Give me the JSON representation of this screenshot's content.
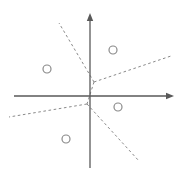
{
  "figure": {
    "title": "",
    "width": 183,
    "height": 174,
    "background_color": "#ffffff",
    "axis_color": "#595959",
    "dashed_color": "#8a8a8a",
    "point_color": "#8a8a8a"
  },
  "chart_data": {
    "type": "scatter",
    "title": "",
    "xlabel": "",
    "ylabel": "",
    "grid": false,
    "legend": null,
    "origin_px": {
      "x": 90,
      "y": 96
    },
    "axes": [
      {
        "name": "x-axis",
        "orientation": "horizontal",
        "start_px": {
          "x": 14,
          "y": 96
        },
        "end_px": {
          "x": 174,
          "y": 96
        },
        "arrow_at": "end",
        "style": "solid"
      },
      {
        "name": "y-axis",
        "orientation": "vertical",
        "start_px": {
          "x": 90,
          "y": 168
        },
        "end_px": {
          "x": 90,
          "y": 13
        },
        "arrow_at": "end",
        "style": "solid"
      }
    ],
    "points": [
      {
        "label": "",
        "marker": "circle-open",
        "x_px": 47,
        "y_px": 69,
        "radius_px": 4
      },
      {
        "label": "",
        "marker": "circle-open",
        "x_px": 113,
        "y_px": 50,
        "radius_px": 4
      },
      {
        "label": "",
        "marker": "circle-open",
        "x_px": 118,
        "y_px": 107,
        "radius_px": 4
      },
      {
        "label": "",
        "marker": "circle-open",
        "x_px": 66,
        "y_px": 139,
        "radius_px": 4
      }
    ],
    "dashed_edges": [
      {
        "name": "upper-left-ray",
        "from_px": {
          "x": 94,
          "y": 82
        },
        "to_px": {
          "x": 59,
          "y": 23
        },
        "style": "dashed"
      },
      {
        "name": "upper-right-ray",
        "from_px": {
          "x": 94,
          "y": 82
        },
        "to_px": {
          "x": 171,
          "y": 56
        },
        "style": "dashed"
      },
      {
        "name": "vertex-connector",
        "from_px": {
          "x": 94,
          "y": 82
        },
        "to_px": {
          "x": 87,
          "y": 104
        },
        "style": "dashed"
      },
      {
        "name": "lower-left-ray",
        "from_px": {
          "x": 87,
          "y": 104
        },
        "to_px": {
          "x": 9,
          "y": 117
        },
        "style": "dashed"
      },
      {
        "name": "lower-right-ray",
        "from_px": {
          "x": 87,
          "y": 104
        },
        "to_px": {
          "x": 139,
          "y": 161
        },
        "style": "dashed"
      }
    ]
  }
}
